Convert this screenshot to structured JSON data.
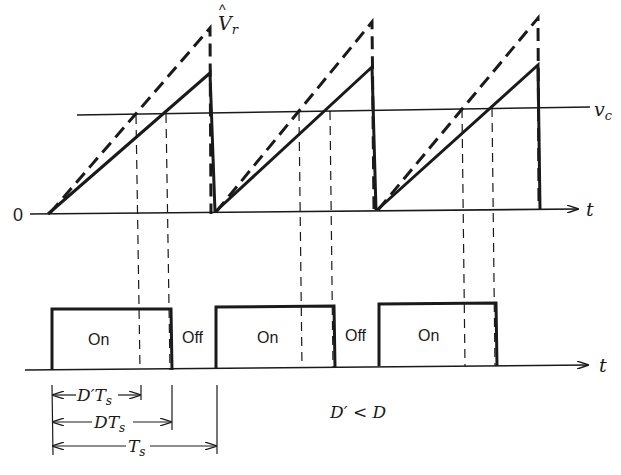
{
  "colors": {
    "ink": "#1a1a1a",
    "background": "#ffffff"
  },
  "labels": {
    "origin": "0",
    "peak": "V",
    "peak_hat": "^",
    "peak_sub": "r",
    "control": "v",
    "control_sub": "c",
    "time_axis_top": "t",
    "time_axis_bottom": "t",
    "on": "On",
    "off": "Off",
    "dprime_ts": "D′T",
    "dprime_ts_sub": "s",
    "d_ts": "DT",
    "d_ts_sub": "s",
    "ts": "T",
    "ts_sub": "s",
    "condition": "D′ < D"
  },
  "diagram": {
    "upper_plot": {
      "signals": [
        "dashed sawtooth (steeper ramp, peak V̂r)",
        "solid sawtooth (shallower ramp)",
        "control voltage vc (horizontal line)"
      ],
      "cycles": 3
    },
    "lower_plot": {
      "pulses": [
        {
          "label": "On"
        },
        {
          "label": "On"
        },
        {
          "label": "On"
        }
      ],
      "gaps": [
        {
          "label": "Off"
        },
        {
          "label": "Off"
        }
      ]
    },
    "dimensions": [
      "D′Ts",
      "DTs",
      "Ts"
    ],
    "note": "D′ < D"
  }
}
